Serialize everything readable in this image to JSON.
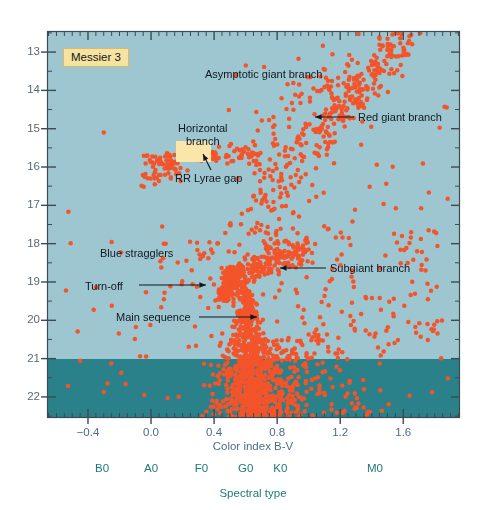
{
  "figure": {
    "cluster_tag": "Messier 3",
    "background_upper_color": "#9ec6d0",
    "background_lower_color": "#2a8189",
    "star_color": "#f4542a",
    "frame_color": "#3c4a52"
  },
  "axes": {
    "y_title": "",
    "y_ticks": [
      13,
      14,
      15,
      16,
      17,
      18,
      19,
      20,
      21,
      22
    ],
    "y_tick_labels": [
      "13",
      "14",
      "15",
      "16",
      "17",
      "18",
      "19",
      "20",
      "21",
      "22"
    ],
    "y_range": [
      12.45,
      22.55
    ],
    "y_minor_step": 0.5,
    "x_title": "Color index B-V",
    "x_ticks": [
      -0.4,
      0.0,
      0.4,
      0.8,
      1.2,
      1.6
    ],
    "x_tick_labels": [
      "−0.4",
      "0.0",
      "0.4",
      "0.8",
      "1.2",
      "1.6"
    ],
    "x_range": [
      -0.66,
      1.96
    ],
    "x_minor_step": 0.05,
    "sptype_title": "Spectral type",
    "sptype_ticks": [
      -0.31,
      0.0,
      0.32,
      0.6,
      0.82,
      1.42
    ],
    "sptype_labels": [
      "B0",
      "A0",
      "F0",
      "G0",
      "K0",
      "M0"
    ]
  },
  "annotations": [
    {
      "name": "asymptotic-giant-branch",
      "text": "Asymptotic giant branch",
      "x": 205,
      "y": 68,
      "arrow": false
    },
    {
      "name": "red-giant-branch",
      "text": "Red giant branch",
      "x": 358,
      "y": 111,
      "arrow": true,
      "arrow_from": [
        354,
        117
      ],
      "arrow_to": [
        315,
        117
      ]
    },
    {
      "name": "horizontal-branch",
      "text": "Horizontal\nbranch",
      "x": 178,
      "y": 122,
      "arrow": false
    },
    {
      "name": "rr-lyrae-gap",
      "text": "RR Lyrae gap",
      "x": 175,
      "y": 172,
      "arrow": true,
      "arrow_from": [
        211,
        170
      ],
      "arrow_to": [
        203,
        154
      ]
    },
    {
      "name": "blue-stragglers",
      "text": "Blue stragglers",
      "x": 100,
      "y": 247,
      "arrow": false
    },
    {
      "name": "turn-off",
      "text": "Turn-off",
      "x": 85,
      "y": 280,
      "arrow": true,
      "arrow_from": [
        139,
        285
      ],
      "arrow_to": [
        206,
        285
      ]
    },
    {
      "name": "subgiant-branch",
      "text": "Subgiant branch",
      "x": 330,
      "y": 262,
      "arrow": true,
      "arrow_from": [
        326,
        268
      ],
      "arrow_to": [
        280,
        268
      ]
    },
    {
      "name": "main-sequence",
      "text": "Main sequence",
      "x": 116,
      "y": 311,
      "arrow": true,
      "arrow_from": [
        199,
        317
      ],
      "arrow_to": [
        257,
        317
      ]
    }
  ],
  "rr_lyrae_gap_box": {
    "x_bv_min": 0.16,
    "x_bv_max": 0.38,
    "mag_min": 15.32,
    "mag_max": 15.88
  },
  "chart_data": {
    "type": "scatter",
    "title": "Messier 3",
    "xlabel": "Color index B-V",
    "ylabel": "Apparent visual magnitude",
    "xlim": [
      -0.66,
      1.96
    ],
    "ylim": [
      22.55,
      12.45
    ],
    "y_inverted": true,
    "grid": false,
    "legend": null,
    "point_color": "#f4542a",
    "point_size_px": 4,
    "total_points": 1780,
    "features": [
      {
        "name": "main-sequence",
        "n": 760,
        "bv_center": 0.6,
        "mag_from": 19.0,
        "mag_to": 22.55,
        "description": "dense near-vertical plume below the turn-off, widening and scattering toward faint magnitudes"
      },
      {
        "name": "turn-off",
        "n": 150,
        "bv_center": 0.47,
        "mag_from": 18.6,
        "mag_to": 19.5,
        "description": "bluest point of the main sequence where it bends to the subgiant branch"
      },
      {
        "name": "subgiant-branch",
        "n": 210,
        "bv_from": 0.52,
        "bv_to": 1.0,
        "mag_from": 18.1,
        "mag_to": 19.1,
        "description": "near-horizontal spur running redward from the turn-off"
      },
      {
        "name": "red-giant-branch",
        "n": 300,
        "bv_from": 0.62,
        "bv_to": 1.62,
        "mag_from": 17.9,
        "mag_to": 12.6,
        "description": "steep branch rising from the subgiant branch to the cluster tip"
      },
      {
        "name": "horizontal-branch",
        "n": 120,
        "bv_from": -0.05,
        "bv_to": 0.7,
        "mag_from": 15.55,
        "mag_to": 15.95,
        "description": "horizontal strip at V~15.7 interrupted by the RR Lyrae instability gap"
      },
      {
        "name": "asymptotic-giant-branch",
        "n": 55,
        "bv_from": 0.75,
        "bv_to": 1.35,
        "mag_from": 15.2,
        "mag_to": 13.2,
        "description": "sparse sequence above and blueward of the red giant branch"
      },
      {
        "name": "blue-stragglers",
        "n": 28,
        "bv_from": 0.05,
        "bv_to": 0.45,
        "mag_from": 17.9,
        "mag_to": 19.7,
        "description": "scattered stars blueward and brighter than the main sequence turn-off"
      },
      {
        "name": "field-scatter",
        "n": 157,
        "bv_from": -0.55,
        "bv_to": 1.9,
        "mag_from": 12.9,
        "mag_to": 22.4,
        "description": "sparse field and red-side scatter filling the diagram"
      }
    ],
    "labeled_points": [
      {
        "label": "bright blue outlier",
        "bv": -0.3,
        "mag": 15.1
      },
      {
        "label": "giant branch tip",
        "bv": 1.54,
        "mag": 12.85
      }
    ]
  }
}
